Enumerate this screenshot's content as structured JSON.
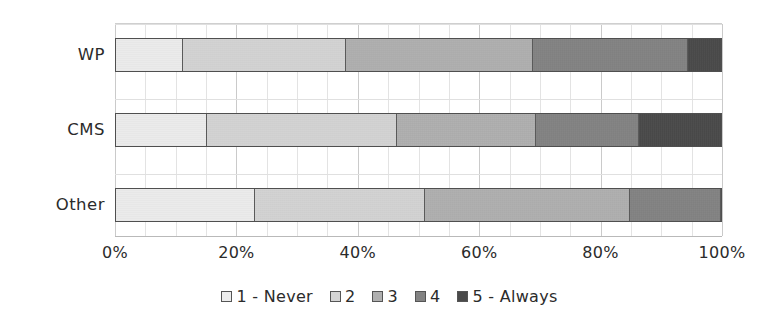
{
  "chart_data": {
    "type": "bar",
    "orientation": "horizontal",
    "stacked": true,
    "normalized": true,
    "title": "",
    "xlabel": "",
    "ylabel": "",
    "xlim": [
      0,
      100
    ],
    "grid": true,
    "legend_position": "bottom",
    "categories": [
      "WP",
      "CMS",
      "Other"
    ],
    "xtick_labels": [
      "0%",
      "20%",
      "40%",
      "60%",
      "80%",
      "100%"
    ],
    "xtick_values": [
      0,
      20,
      40,
      60,
      80,
      100
    ],
    "series": [
      {
        "name": "1 - Never",
        "color": "#ededed",
        "values": [
          11.0,
          15.0,
          23.0
        ]
      },
      {
        "name": "2",
        "color": "#d4d4d4",
        "values": [
          27.0,
          31.5,
          28.0
        ]
      },
      {
        "name": "3",
        "color": "#b0b0b0",
        "values": [
          31.0,
          23.0,
          34.0
        ]
      },
      {
        "name": "4",
        "color": "#838383",
        "values": [
          25.5,
          17.0,
          15.0
        ]
      },
      {
        "name": "5 - Always",
        "color": "#4a4a4a",
        "values": [
          5.5,
          13.5,
          0.0
        ]
      }
    ],
    "cumulative_boundaries": {
      "WP": [
        11.0,
        38.0,
        69.0,
        94.5,
        100.0
      ],
      "CMS": [
        15.0,
        46.5,
        69.5,
        86.5,
        100.0
      ],
      "Other": [
        23.0,
        51.0,
        85.0,
        100.0,
        100.0
      ]
    },
    "legend": [
      {
        "label": "1 - Never",
        "color": "#ededed"
      },
      {
        "label": "2",
        "color": "#d4d4d4"
      },
      {
        "label": "3",
        "color": "#b0b0b0"
      },
      {
        "label": "4",
        "color": "#838383"
      },
      {
        "label": "5 - Always",
        "color": "#4a4a4a"
      }
    ]
  },
  "axes": {
    "minor_gridline_step_pct": 5,
    "major_gridline_step_pct": 20
  }
}
